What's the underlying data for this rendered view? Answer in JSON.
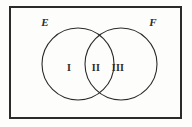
{
  "figure": {
    "type": "venn-diagram",
    "background_color": "#fdfdfc",
    "stroke_color": "#2b2b2b",
    "universe": {
      "name": "universal-set-rectangle",
      "x": 10,
      "y": 7,
      "width": 171,
      "height": 111,
      "stroke_width": 1.2
    },
    "sets": [
      {
        "id": "E",
        "label": "E",
        "cx": 78,
        "cy": 64,
        "r": 36,
        "label_x": 43,
        "label_y": 26
      },
      {
        "id": "F",
        "label": "F",
        "cx": 121,
        "cy": 64,
        "r": 36,
        "label_x": 151,
        "label_y": 26
      }
    ],
    "regions": [
      {
        "id": "region-1",
        "label": "I",
        "meaning": "E only",
        "x": 69,
        "y": 71
      },
      {
        "id": "region-2",
        "label": "II",
        "meaning": "E and F intersection",
        "x": 96,
        "y": 71
      },
      {
        "id": "region-3",
        "label": "III",
        "meaning": "F only",
        "x": 118,
        "y": 71
      }
    ]
  }
}
